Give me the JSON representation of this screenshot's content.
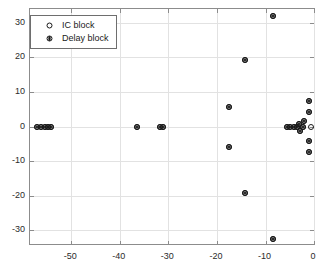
{
  "chart_data": {
    "type": "scatter",
    "title": "",
    "xlabel": "",
    "ylabel": "",
    "xlim": [
      -58.5,
      0.4
    ],
    "ylim": [
      -34.5,
      34.0
    ],
    "xticks": [
      -50,
      -40,
      -30,
      -20,
      -10,
      0
    ],
    "xticklabels": [
      "-50",
      "-40",
      "-30",
      "-20",
      "-10",
      "0"
    ],
    "yticks": [
      30,
      20,
      10,
      0,
      -10,
      -20,
      -30
    ],
    "yticklabels": [
      "30",
      "20",
      "10",
      "0",
      "-10",
      "-20",
      "-30"
    ],
    "grid": true,
    "legend_position": "upper-left",
    "marker_color": "#1a1a1a",
    "grid_color": "#e2e2e2",
    "axis_color": "#8c8c8c",
    "series": [
      {
        "name": "IC block",
        "marker": "circle-open",
        "points": [
          {
            "x": -57.0,
            "y": 0.0
          },
          {
            "x": -56.2,
            "y": 0.0
          },
          {
            "x": -55.5,
            "y": 0.0
          },
          {
            "x": -54.8,
            "y": 0.0
          },
          {
            "x": -54.1,
            "y": 0.0
          },
          {
            "x": -36.5,
            "y": 0.0
          },
          {
            "x": -31.8,
            "y": 0.0
          },
          {
            "x": -31.1,
            "y": 0.0
          },
          {
            "x": -17.6,
            "y": 5.8
          },
          {
            "x": -17.6,
            "y": -5.9
          },
          {
            "x": -14.3,
            "y": 19.4
          },
          {
            "x": -14.3,
            "y": -19.3
          },
          {
            "x": -8.4,
            "y": 32.0
          },
          {
            "x": -8.4,
            "y": -32.4
          },
          {
            "x": -5.6,
            "y": 0.0
          },
          {
            "x": -4.9,
            "y": 0.0
          },
          {
            "x": -4.2,
            "y": 0.0
          },
          {
            "x": -3.5,
            "y": 0.0
          },
          {
            "x": -3.0,
            "y": 0.9
          },
          {
            "x": -2.9,
            "y": -1.2
          },
          {
            "x": -2.2,
            "y": 0.0
          },
          {
            "x": -2.1,
            "y": 1.5
          },
          {
            "x": -0.6,
            "y": 0.0
          },
          {
            "x": -1.0,
            "y": 7.5
          },
          {
            "x": -1.0,
            "y": 4.1
          },
          {
            "x": -1.0,
            "y": -4.2
          },
          {
            "x": -1.0,
            "y": -7.4
          }
        ]
      },
      {
        "name": "Delay block",
        "marker": "circle-asterisk",
        "points": [
          {
            "x": -57.0,
            "y": 0.0
          },
          {
            "x": -56.2,
            "y": 0.0
          },
          {
            "x": -55.5,
            "y": 0.0
          },
          {
            "x": -54.8,
            "y": 0.0
          },
          {
            "x": -54.1,
            "y": 0.0
          },
          {
            "x": -36.5,
            "y": 0.0
          },
          {
            "x": -31.8,
            "y": 0.0
          },
          {
            "x": -31.1,
            "y": 0.0
          },
          {
            "x": -17.6,
            "y": 5.8
          },
          {
            "x": -17.6,
            "y": -5.9
          },
          {
            "x": -14.3,
            "y": 19.4
          },
          {
            "x": -14.3,
            "y": -19.3
          },
          {
            "x": -8.4,
            "y": 32.0
          },
          {
            "x": -8.4,
            "y": -32.4
          },
          {
            "x": -5.6,
            "y": 0.0
          },
          {
            "x": -4.9,
            "y": 0.0
          },
          {
            "x": -4.2,
            "y": 0.0
          },
          {
            "x": -3.5,
            "y": 0.0
          },
          {
            "x": -3.0,
            "y": 0.9
          },
          {
            "x": -2.9,
            "y": -1.2
          },
          {
            "x": -2.2,
            "y": 0.0
          },
          {
            "x": -2.1,
            "y": 1.5
          },
          {
            "x": -1.0,
            "y": 7.5
          },
          {
            "x": -1.0,
            "y": 4.1
          },
          {
            "x": -1.0,
            "y": -4.2
          },
          {
            "x": -1.0,
            "y": -7.4
          }
        ]
      }
    ]
  },
  "legend": {
    "entries": [
      {
        "label": "IC block",
        "marker": "circle-open"
      },
      {
        "label": "Delay block",
        "marker": "circle-asterisk"
      }
    ]
  }
}
